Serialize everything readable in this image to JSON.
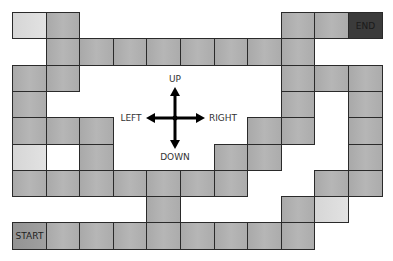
{
  "board": {
    "grid": {
      "cols": 11,
      "rows": 9,
      "origin_x": 12,
      "origin_y": 12,
      "cell_w": 33.6,
      "cell_h": 26.3
    },
    "colors": {
      "tile": "#b0b0b0",
      "light_tile": "#dcdcdc",
      "start_tile": "#999999",
      "end_tile": "#3b3b3b",
      "border": "#2a2a2a"
    },
    "cells": [
      {
        "r": 0,
        "c": 0,
        "type": "light"
      },
      {
        "r": 0,
        "c": 1,
        "type": "tile"
      },
      {
        "r": 0,
        "c": 8,
        "type": "tile"
      },
      {
        "r": 0,
        "c": 9,
        "type": "tile"
      },
      {
        "r": 0,
        "c": 10,
        "type": "end",
        "label": "END"
      },
      {
        "r": 1,
        "c": 1,
        "type": "tile"
      },
      {
        "r": 1,
        "c": 2,
        "type": "tile"
      },
      {
        "r": 1,
        "c": 3,
        "type": "tile"
      },
      {
        "r": 1,
        "c": 4,
        "type": "tile"
      },
      {
        "r": 1,
        "c": 5,
        "type": "tile"
      },
      {
        "r": 1,
        "c": 6,
        "type": "tile"
      },
      {
        "r": 1,
        "c": 7,
        "type": "tile"
      },
      {
        "r": 1,
        "c": 8,
        "type": "tile"
      },
      {
        "r": 2,
        "c": 0,
        "type": "tile"
      },
      {
        "r": 2,
        "c": 1,
        "type": "tile"
      },
      {
        "r": 2,
        "c": 8,
        "type": "tile"
      },
      {
        "r": 2,
        "c": 9,
        "type": "tile"
      },
      {
        "r": 2,
        "c": 10,
        "type": "tile"
      },
      {
        "r": 3,
        "c": 0,
        "type": "tile"
      },
      {
        "r": 3,
        "c": 8,
        "type": "tile"
      },
      {
        "r": 3,
        "c": 10,
        "type": "tile"
      },
      {
        "r": 4,
        "c": 0,
        "type": "tile"
      },
      {
        "r": 4,
        "c": 1,
        "type": "tile"
      },
      {
        "r": 4,
        "c": 2,
        "type": "tile"
      },
      {
        "r": 4,
        "c": 7,
        "type": "tile"
      },
      {
        "r": 4,
        "c": 8,
        "type": "tile"
      },
      {
        "r": 4,
        "c": 10,
        "type": "tile"
      },
      {
        "r": 5,
        "c": 0,
        "type": "light"
      },
      {
        "r": 5,
        "c": 1,
        "type": "blank"
      },
      {
        "r": 5,
        "c": 2,
        "type": "tile"
      },
      {
        "r": 5,
        "c": 6,
        "type": "tile"
      },
      {
        "r": 5,
        "c": 7,
        "type": "tile"
      },
      {
        "r": 5,
        "c": 10,
        "type": "tile"
      },
      {
        "r": 6,
        "c": 0,
        "type": "tile"
      },
      {
        "r": 6,
        "c": 1,
        "type": "tile"
      },
      {
        "r": 6,
        "c": 2,
        "type": "tile"
      },
      {
        "r": 6,
        "c": 3,
        "type": "tile"
      },
      {
        "r": 6,
        "c": 4,
        "type": "tile"
      },
      {
        "r": 6,
        "c": 5,
        "type": "tile"
      },
      {
        "r": 6,
        "c": 6,
        "type": "tile"
      },
      {
        "r": 6,
        "c": 9,
        "type": "tile"
      },
      {
        "r": 6,
        "c": 10,
        "type": "tile"
      },
      {
        "r": 7,
        "c": 4,
        "type": "tile"
      },
      {
        "r": 7,
        "c": 8,
        "type": "tile"
      },
      {
        "r": 7,
        "c": 9,
        "type": "light"
      },
      {
        "r": 8,
        "c": 0,
        "type": "start",
        "label": "START"
      },
      {
        "r": 8,
        "c": 1,
        "type": "tile"
      },
      {
        "r": 8,
        "c": 2,
        "type": "tile"
      },
      {
        "r": 8,
        "c": 3,
        "type": "tile"
      },
      {
        "r": 8,
        "c": 4,
        "type": "tile"
      },
      {
        "r": 8,
        "c": 5,
        "type": "tile"
      },
      {
        "r": 8,
        "c": 6,
        "type": "tile"
      },
      {
        "r": 8,
        "c": 7,
        "type": "tile"
      },
      {
        "r": 8,
        "c": 8,
        "type": "tile"
      }
    ]
  },
  "compass": {
    "center": [
      175,
      118
    ],
    "color": "#000000",
    "labels": {
      "up": "UP",
      "down": "DOWN",
      "left": "LEFT",
      "right": "RIGHT"
    }
  }
}
